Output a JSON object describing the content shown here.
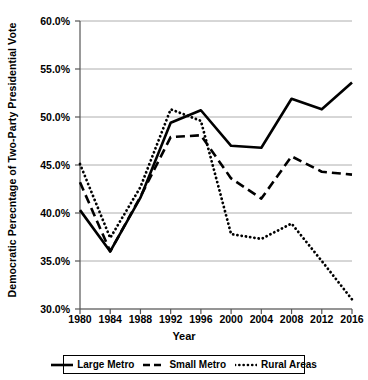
{
  "chart_data": {
    "type": "line",
    "title": "",
    "xlabel": "Year",
    "ylabel": "Democratic Perecntage of Two-Party Presidential Vote",
    "x": [
      1980,
      1984,
      1988,
      1992,
      1996,
      2000,
      2004,
      2008,
      2012,
      2016
    ],
    "categories": [
      "1980",
      "1984",
      "1988",
      "1992",
      "1996",
      "2000",
      "2004",
      "2008",
      "2012",
      "2016"
    ],
    "xlim": [
      1980,
      2016
    ],
    "ylim": [
      30.0,
      60.0
    ],
    "ytick_labels": [
      "60.0%",
      "55.0%",
      "50.0%",
      "45.0%",
      "40.0%",
      "35.0%",
      "30.0%"
    ],
    "ytick_values": [
      60.0,
      55.0,
      50.0,
      45.0,
      40.0,
      35.0,
      30.0
    ],
    "grid": true,
    "legend_position": "bottom",
    "series": [
      {
        "name": "Large Metro",
        "style": "solid",
        "color": "#000000",
        "values": [
          40.3,
          36.0,
          41.6,
          49.4,
          50.7,
          47.0,
          46.8,
          51.9,
          50.8,
          53.6
        ]
      },
      {
        "name": "Small Metro",
        "style": "dashed",
        "color": "#000000",
        "values": [
          43.2,
          36.0,
          41.7,
          47.9,
          48.1,
          43.6,
          41.5,
          45.9,
          44.3,
          44.0
        ]
      },
      {
        "name": "Rural Areas",
        "style": "dotted",
        "color": "#000000",
        "values": [
          45.1,
          37.4,
          42.7,
          50.8,
          49.6,
          37.8,
          37.3,
          38.9,
          35.0,
          31.0
        ]
      }
    ]
  },
  "legend": {
    "items": [
      {
        "label": "Large Metro",
        "style": "solid"
      },
      {
        "label": "Small Metro",
        "style": "dashed"
      },
      {
        "label": "Rural Areas",
        "style": "dotted"
      }
    ]
  }
}
